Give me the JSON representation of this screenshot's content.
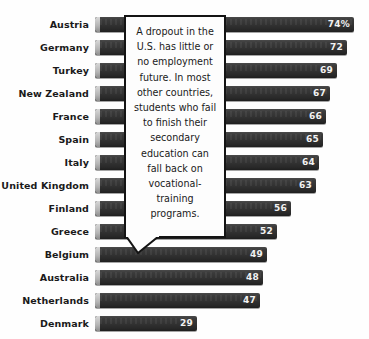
{
  "chart_data": {
    "type": "bar",
    "orientation": "horizontal",
    "title": "",
    "subtitle": "",
    "xlabel": "",
    "ylabel": "",
    "grid": false,
    "legend": null,
    "xlim": [
      0,
      74
    ],
    "unit": "percent",
    "categories": [
      "Austria",
      "Germany",
      "Turkey",
      "New Zealand",
      "France",
      "Spain",
      "Italy",
      "United Kingdom",
      "Finland",
      "Greece",
      "Belgium",
      "Australia",
      "Netherlands",
      "Denmark",
      "United States",
      "Sweden",
      "Japan"
    ],
    "values": [
      74,
      72,
      69,
      67,
      66,
      65,
      64,
      63,
      56,
      52,
      49,
      48,
      47,
      29,
      25,
      24,
      12
    ],
    "value_labels": [
      "74%",
      "72",
      "69",
      "67",
      "66",
      "65",
      "64",
      "63",
      "56",
      "52",
      "49",
      "48",
      "47",
      "29",
      "25",
      "24",
      "12"
    ],
    "highlighted_category": "United States",
    "annotations": [
      {
        "name": "callout",
        "text": "A dropout in the U.S. has little or no employment future. In most other countries, students who fail to finish their secondary education can fall back on vocational-training programs.",
        "points_to": "Netherlands"
      }
    ]
  },
  "rows": [
    {
      "label": "Austria",
      "value": 74,
      "value_label": "74%",
      "muted": false
    },
    {
      "label": "Germany",
      "value": 72,
      "value_label": "72",
      "muted": false
    },
    {
      "label": "Turkey",
      "value": 69,
      "value_label": "69",
      "muted": false
    },
    {
      "label": "New Zealand",
      "value": 67,
      "value_label": "67",
      "muted": false
    },
    {
      "label": "France",
      "value": 66,
      "value_label": "66",
      "muted": false
    },
    {
      "label": "Spain",
      "value": 65,
      "value_label": "65",
      "muted": false
    },
    {
      "label": "Italy",
      "value": 64,
      "value_label": "64",
      "muted": false
    },
    {
      "label": "United Kingdom",
      "value": 63,
      "value_label": "63",
      "muted": false
    },
    {
      "label": "Finland",
      "value": 56,
      "value_label": "56",
      "muted": false
    },
    {
      "label": "Greece",
      "value": 52,
      "value_label": "52",
      "muted": false
    },
    {
      "label": "Belgium",
      "value": 49,
      "value_label": "49",
      "muted": false
    },
    {
      "label": "Australia",
      "value": 48,
      "value_label": "48",
      "muted": false
    },
    {
      "label": "Netherlands",
      "value": 47,
      "value_label": "47",
      "muted": false
    },
    {
      "label": "Denmark",
      "value": 29,
      "value_label": "29",
      "muted": false
    },
    {
      "label": "United States",
      "value": 25,
      "value_label": "25",
      "muted": true
    },
    {
      "label": "Sweden",
      "value": 24,
      "value_label": "24",
      "muted": false
    },
    {
      "label": "Japan",
      "value": 12,
      "value_label": "12",
      "muted": false
    }
  ],
  "callout": {
    "text": "A dropout in the U.S. has little or no employment future. In most other countries, students who fail to finish their secondary education can fall back on vocational-training programs."
  },
  "style": {
    "bar_color": "#333333",
    "bar_cap_color": "#c0c0c0",
    "value_text_color": "#f2f2f2",
    "label_color": "#1a1a1a",
    "muted_label_color": "#a8a8a8",
    "background": "#fefefe",
    "callout_border": "#141414",
    "callout_background": "#fdfdfd"
  },
  "layout": {
    "bar_origin_x": 95,
    "px_per_unit": 3.5,
    "row_pitch": 23,
    "first_row_top": 17,
    "bar_height": 15
  }
}
